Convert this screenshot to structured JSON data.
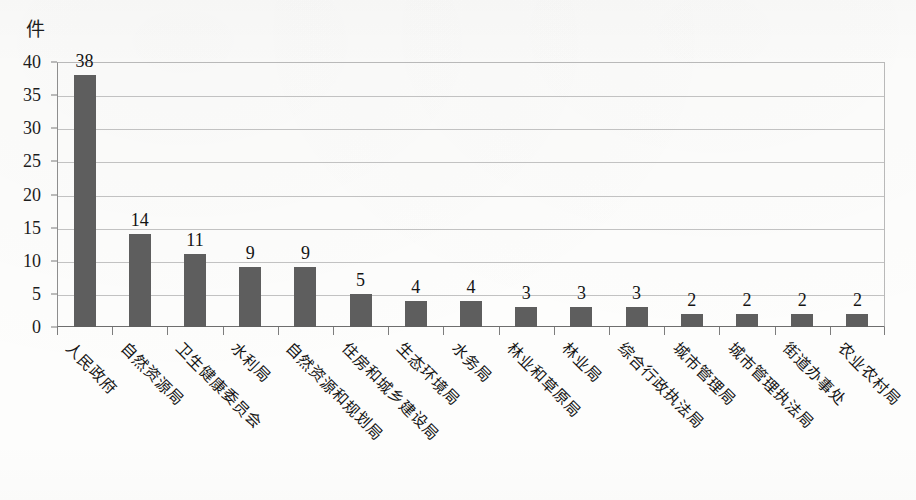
{
  "unit_label": "件",
  "chart_data": {
    "type": "bar",
    "title": "",
    "subtitle": "",
    "xlabel": "",
    "ylabel": "件",
    "ylim": [
      0,
      40
    ],
    "ytick_step": 5,
    "yticks": [
      0,
      5,
      10,
      15,
      20,
      25,
      30,
      35,
      40
    ],
    "grid": true,
    "legend": "none",
    "orientation": "vertical",
    "bar_color": "#5e5e5e",
    "categories": [
      "人民政府",
      "自然资源局",
      "卫生健康委员会",
      "水利局",
      "自然资源和规划局",
      "住房和城乡建设局",
      "生态环境局",
      "水务局",
      "林业和草原局",
      "林业局",
      "综合行政执法局",
      "城市管理局",
      "城市管理执法局",
      "街道办事处",
      "农业农村局"
    ],
    "values": [
      38,
      14,
      11,
      9,
      9,
      5,
      4,
      4,
      3,
      3,
      3,
      2,
      2,
      2,
      2
    ],
    "data_labels": [
      "38",
      "14",
      "11",
      "9",
      "9",
      "5",
      "4",
      "4",
      "3",
      "3",
      "3",
      "2",
      "2",
      "2",
      "2"
    ]
  },
  "colors": {
    "bar": "#5e5e5e",
    "gridline": "#c2c2c2",
    "axis": "#6e6e6e",
    "text": "#151515",
    "background": "#fdfdfc"
  }
}
